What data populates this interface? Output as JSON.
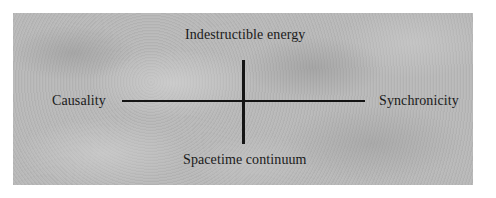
{
  "diagram": {
    "type": "quadrant-axes",
    "background_color": "#b9b9b9",
    "line_color": "#141414",
    "text_color": "#1a1a1a",
    "axes": {
      "vertical": {
        "top_label": "Indestructible energy",
        "bottom_label": "Spacetime continuum"
      },
      "horizontal": {
        "left_label": "Causality",
        "right_label": "Synchronicity"
      }
    }
  }
}
